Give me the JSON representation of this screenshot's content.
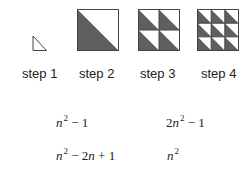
{
  "colors": {
    "fill": "#5f5f5f",
    "stroke": "#444444",
    "background": "#ffffff"
  },
  "steps": [
    {
      "label": "step 1",
      "grid": 0
    },
    {
      "label": "step 2",
      "grid": 1
    },
    {
      "label": "step 3",
      "grid": 2
    },
    {
      "label": "step 4",
      "grid": 3
    }
  ],
  "formulas": [
    {
      "base": "n",
      "exp": "2",
      "rest": " − 1",
      "prefix": ""
    },
    {
      "base": "n",
      "exp": "2",
      "rest": " − 1",
      "prefix": "2"
    },
    {
      "base": "n",
      "exp": "2",
      "rest": " − 2",
      "rest_var": "n",
      "rest_tail": " + 1",
      "prefix": ""
    },
    {
      "base": "n",
      "exp": "2",
      "rest": "",
      "prefix": ""
    }
  ]
}
